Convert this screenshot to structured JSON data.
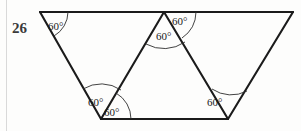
{
  "figure": {
    "problem_number": "26",
    "stroke_color": "#1b1b1b",
    "arc_color": "#2e2e2e",
    "label_color": "#1a1a1a",
    "number_color": "#3a3a3a",
    "background_color": "#fdfdfc",
    "vertices": {
      "top_left": [
        40,
        12
      ],
      "top_apex": [
        164,
        12
      ],
      "top_right": [
        293,
        12
      ],
      "bottom_left": [
        101,
        119
      ],
      "bottom_right": [
        228,
        119
      ]
    },
    "edges": [
      {
        "name": "top-edge",
        "from": [
          40,
          12
        ],
        "to": [
          293,
          12
        ]
      },
      {
        "name": "left-leg",
        "from": [
          40,
          12
        ],
        "to": [
          101,
          119
        ]
      },
      {
        "name": "right-leg",
        "from": [
          293,
          12
        ],
        "to": [
          228,
          119
        ]
      },
      {
        "name": "bottom-edge",
        "from": [
          101,
          119
        ],
        "to": [
          228,
          119
        ]
      },
      {
        "name": "middle-left-leg",
        "from": [
          164,
          12
        ],
        "to": [
          101,
          119
        ]
      },
      {
        "name": "middle-right-leg",
        "from": [
          164,
          12
        ],
        "to": [
          228,
          119
        ]
      }
    ],
    "angles": [
      {
        "id": "top-left",
        "value": "60°",
        "label_x": 48,
        "label_y": 20
      },
      {
        "id": "apex-inner",
        "value": "60°",
        "label_x": 156,
        "label_y": 30
      },
      {
        "id": "apex-right",
        "value": "60°",
        "label_x": 172,
        "label_y": 15
      },
      {
        "id": "bottom-left-upper",
        "value": "60°",
        "label_x": 88,
        "label_y": 96
      },
      {
        "id": "bottom-left-lower",
        "value": "60°",
        "label_x": 104,
        "label_y": 106
      },
      {
        "id": "bottom-right",
        "value": "60°",
        "label_x": 207,
        "label_y": 96
      }
    ]
  }
}
